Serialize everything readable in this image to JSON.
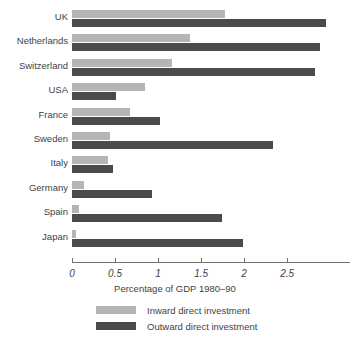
{
  "chart_data": {
    "type": "bar",
    "orientation": "horizontal",
    "title": "",
    "xlabel": "Percentage of GDP 1980–90",
    "ylabel": "",
    "xlim": [
      0,
      3.23
    ],
    "xticks": [
      0,
      0.5,
      1,
      1.5,
      2,
      2.5
    ],
    "xticklabels": [
      "0",
      "0.5",
      "1",
      "1.5",
      "2",
      "2.5"
    ],
    "grid": false,
    "legend_position": "bottom",
    "categories": [
      "UK",
      "Netherlands",
      "Switzerland",
      "USA",
      "France",
      "Sweden",
      "Italy",
      "Germany",
      "Spain",
      "Japan"
    ],
    "series": [
      {
        "name": "Inward direct investment",
        "color": "#b5b5b5",
        "values": [
          1.78,
          1.37,
          1.16,
          0.85,
          0.67,
          0.44,
          0.42,
          0.14,
          0.08,
          0.05
        ]
      },
      {
        "name": "Outward direct investment",
        "color": "#4b4b4b",
        "values": [
          2.95,
          2.88,
          2.82,
          0.51,
          1.02,
          2.34,
          0.48,
          0.93,
          1.74,
          1.99
        ]
      }
    ]
  },
  "axis": {
    "title": "Percentage of GDP 1980–90",
    "ticks": [
      {
        "value": 0,
        "label": "0"
      },
      {
        "value": 0.5,
        "label": "0.5"
      },
      {
        "value": 1,
        "label": "1"
      },
      {
        "value": 1.5,
        "label": "1.5"
      },
      {
        "value": 2,
        "label": "2"
      },
      {
        "value": 2.5,
        "label": "2.5"
      }
    ]
  },
  "legend": {
    "items": [
      {
        "label": "Inward direct investment",
        "color": "#b5b5b5",
        "key": "inward"
      },
      {
        "label": "Outward direct investment",
        "color": "#4b4b4b",
        "key": "outward"
      }
    ]
  },
  "colors": {
    "inward": "#b5b5b5",
    "outward": "#4b4b4b",
    "axis": "#6e6e6e",
    "text": "#3f3f3f",
    "background": "#ffffff"
  }
}
